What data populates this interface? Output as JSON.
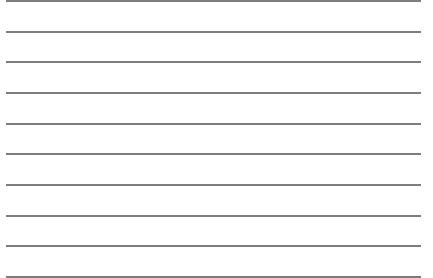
{
  "sheet": {
    "type": "ruled-paper",
    "background_color": "#ffffff",
    "line_color": "#7d7d7d",
    "line_count": 10,
    "line_spacing_px": 30.7,
    "lines": [
      {
        "y": 0
      },
      {
        "y": 31
      },
      {
        "y": 61
      },
      {
        "y": 92
      },
      {
        "y": 123
      },
      {
        "y": 153
      },
      {
        "y": 184
      },
      {
        "y": 215
      },
      {
        "y": 245
      },
      {
        "y": 276
      }
    ]
  }
}
